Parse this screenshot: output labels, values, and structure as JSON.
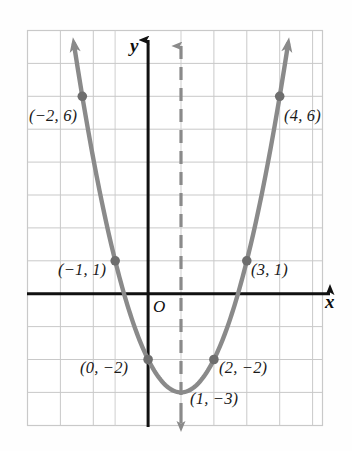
{
  "figure": {
    "background_color": "#fefefe"
  },
  "axes": {
    "x_axis_label": "x",
    "y_axis_label": "y",
    "origin_label": "O",
    "axis_color": "#111111",
    "grid_color": "#c9c9c9",
    "grid_on": true,
    "x_range": [
      -3.7,
      5.3
    ],
    "y_range": [
      -4.0,
      8.0
    ],
    "unit_px": 32.9
  },
  "curve": {
    "color": "#8a8a8a",
    "equation": "y = x^2 - 2x - 2",
    "vertex": [
      1,
      -3
    ],
    "arrow_ends": true
  },
  "symmetry_axis": {
    "x": 1,
    "style": "dashed",
    "color": "#8a8a8a",
    "arrow_up": true,
    "arrow_down": true
  },
  "chart_data": {
    "type": "scatter",
    "title": "",
    "xlabel": "x",
    "ylabel": "y",
    "xlim": [
      -3.7,
      5.3
    ],
    "ylim": [
      -4.0,
      8.0
    ],
    "grid": true,
    "legend": "none",
    "equation": "y = x^2 - 2x - 2",
    "x": [
      -2,
      -1,
      0,
      1,
      2,
      3,
      4
    ],
    "values": [
      6,
      1,
      -2,
      -3,
      -2,
      1,
      6
    ],
    "points": [
      {
        "x": -2,
        "y": 6,
        "label": "(−2, 6)",
        "label_side": "left",
        "px": 82,
        "py": 97,
        "lx": 29,
        "ly": 115
      },
      {
        "x": -1,
        "y": 1,
        "label": "(−1, 1)",
        "label_side": "left",
        "px": 115,
        "py": 261,
        "lx": 58,
        "ly": 268
      },
      {
        "x": 0,
        "y": -2,
        "label": "(0, −2)",
        "label_side": "left",
        "px": 148,
        "py": 360,
        "lx": 80,
        "ly": 365
      },
      {
        "x": 1,
        "y": -3,
        "label": "(1, −3)",
        "label_side": "right",
        "px": 181,
        "py": 393,
        "lx": 190,
        "ly": 396
      },
      {
        "x": 2,
        "y": -2,
        "label": "(2, −2)",
        "label_side": "right",
        "px": 214,
        "py": 360,
        "lx": 218,
        "ly": 365
      },
      {
        "x": 3,
        "y": 1,
        "label": "(3, 1)",
        "label_side": "right",
        "px": 247,
        "py": 261,
        "lx": 250,
        "ly": 268
      },
      {
        "x": 4,
        "y": 6,
        "label": "(4, 6)",
        "label_side": "right",
        "px": 280,
        "py": 97,
        "lx": 284,
        "ly": 115
      }
    ],
    "point_color": "#6e6e6e",
    "curve_color": "#8a8a8a"
  }
}
